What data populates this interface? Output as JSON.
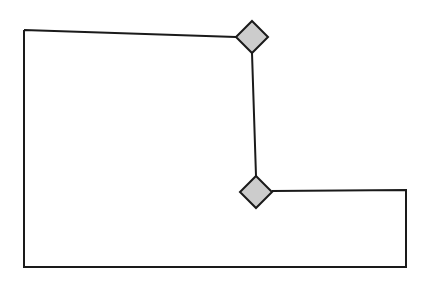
{
  "figure": {
    "kind": "polygon-outline-diagram",
    "title": "",
    "background_color": "#ffffff",
    "width": 430,
    "height": 286
  },
  "style": {
    "stroke_color": "#1a1a1a",
    "stroke_width": 2,
    "node_fill_color": "#cccccc",
    "node_stroke_color": "#1a1a1a",
    "node_stroke_width": 2
  },
  "shape": {
    "name": "L-shaped polygon outline",
    "closed": true,
    "vertices": [
      {
        "label": "top-left-corner",
        "x": 24,
        "y": 30
      },
      {
        "label": "top-node-left",
        "x": 236,
        "y": 37
      },
      {
        "label": "top-node-bottom",
        "x": 252,
        "y": 53
      },
      {
        "label": "bottom-node-top",
        "x": 256,
        "y": 176
      },
      {
        "label": "bottom-node-right",
        "x": 272,
        "y": 191
      },
      {
        "label": "right-upper-corner",
        "x": 406,
        "y": 190
      },
      {
        "label": "bottom-right-corner",
        "x": 406,
        "y": 267
      },
      {
        "label": "bottom-left-corner",
        "x": 24,
        "y": 267
      }
    ],
    "path_d": "M 24 30 L 236 37 M 252 53 L 256 176 M 272 191 L 406 190 L 406 267 L 24 267 L 24 30",
    "edges": [
      {
        "label": "top-edge",
        "from": "top-left-corner",
        "to": "top-node-left"
      },
      {
        "label": "connector-edge",
        "from": "top-node-bottom",
        "to": "bottom-node-top"
      },
      {
        "label": "right-horizontal-edge",
        "from": "bottom-node-right",
        "to": "right-upper-corner"
      },
      {
        "label": "right-edge",
        "from": "right-upper-corner",
        "to": "bottom-right-corner"
      },
      {
        "label": "bottom-edge",
        "from": "bottom-right-corner",
        "to": "bottom-left-corner"
      },
      {
        "label": "left-edge",
        "from": "bottom-left-corner",
        "to": "top-left-corner"
      }
    ]
  },
  "nodes": [
    {
      "id": "node-top",
      "label": "",
      "shape": "diamond",
      "center_x": 252,
      "center_y": 37,
      "half_diagonal": 16,
      "points": "252,21 268,37 252,53 236,37"
    },
    {
      "id": "node-bottom",
      "label": "",
      "shape": "diamond",
      "center_x": 256,
      "center_y": 192,
      "half_diagonal": 16,
      "points": "256,176 272,192 256,208 240,192"
    }
  ]
}
